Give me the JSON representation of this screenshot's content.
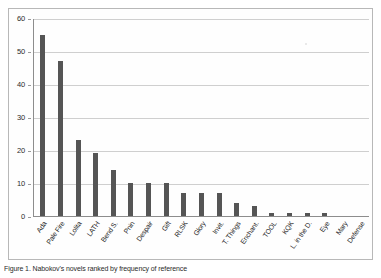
{
  "figure": {
    "caption": "Figure 1. Nabokov's novels ranked by frequency of reference",
    "background": "#ffffff",
    "frame_color": "#b8b8b8"
  },
  "chart_data": {
    "type": "bar",
    "title": "",
    "xlabel": "",
    "ylabel": "",
    "ylim": [
      0,
      60
    ],
    "yticks": [
      0,
      10,
      20,
      30,
      40,
      50,
      60
    ],
    "grid": true,
    "legend": "none",
    "bar_color": "#555555",
    "categories": [
      "Ada",
      "Pale Fire",
      "Lolita",
      "LATH",
      "Bend S.",
      "Pnin",
      "Despair",
      "Gift",
      "RLSK",
      "Glory",
      "Invit.",
      "T. Things",
      "Enchant.",
      "TOOL",
      "KQK",
      "L. in the D.",
      "Eye",
      "Mary",
      "Defense"
    ],
    "values": [
      55,
      47,
      23,
      19,
      14,
      10,
      10,
      10,
      7,
      7,
      7,
      4,
      3,
      1,
      1,
      1,
      1,
      0,
      0
    ]
  }
}
